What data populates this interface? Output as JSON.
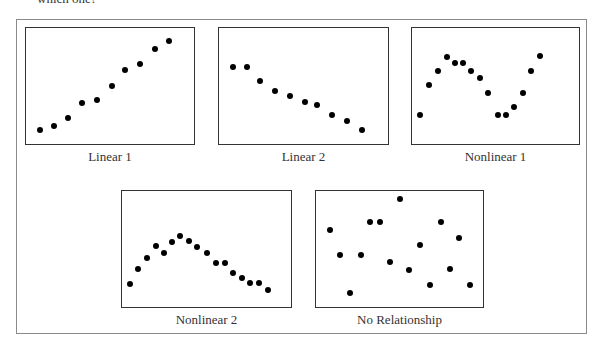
{
  "header": {
    "partial_text": "which one?"
  },
  "chart_data": [
    {
      "type": "scatter",
      "title": "Linear 1",
      "box": {
        "left": 25,
        "top": 27,
        "right": 195,
        "bottom": 145
      },
      "points": [
        [
          40,
          130
        ],
        [
          54,
          126
        ],
        [
          68,
          118
        ],
        [
          82,
          103
        ],
        [
          97,
          100
        ],
        [
          112,
          86
        ],
        [
          125,
          70
        ],
        [
          140,
          64
        ],
        [
          155,
          49
        ],
        [
          169,
          41
        ]
      ],
      "description": "Positive linear relationship"
    },
    {
      "type": "scatter",
      "title": "Linear 2",
      "box": {
        "left": 218,
        "top": 27,
        "right": 389,
        "bottom": 145
      },
      "points": [
        [
          233,
          67
        ],
        [
          247,
          67
        ],
        [
          260,
          81
        ],
        [
          275,
          91
        ],
        [
          290,
          96
        ],
        [
          305,
          102
        ],
        [
          317,
          105
        ],
        [
          332,
          115
        ],
        [
          347,
          121
        ],
        [
          362,
          130
        ]
      ],
      "description": "Negative linear relationship"
    },
    {
      "type": "scatter",
      "title": "Nonlinear 1",
      "box": {
        "left": 411,
        "top": 27,
        "right": 580,
        "bottom": 145
      },
      "points": [
        [
          420,
          115
        ],
        [
          429,
          85
        ],
        [
          438,
          71
        ],
        [
          447,
          57
        ],
        [
          455,
          63
        ],
        [
          463,
          63
        ],
        [
          471,
          71
        ],
        [
          480,
          78
        ],
        [
          488,
          93
        ],
        [
          498,
          115
        ],
        [
          506,
          115
        ],
        [
          514,
          107
        ],
        [
          523,
          93
        ],
        [
          531,
          71
        ],
        [
          540,
          56
        ]
      ],
      "description": "Wave-shaped (cubic) relationship"
    },
    {
      "type": "scatter",
      "title": "Nonlinear 2",
      "box": {
        "left": 121,
        "top": 190,
        "right": 292,
        "bottom": 308
      },
      "points": [
        [
          130,
          284
        ],
        [
          138,
          269
        ],
        [
          147,
          258
        ],
        [
          156,
          246
        ],
        [
          164,
          253
        ],
        [
          172,
          242
        ],
        [
          180,
          236
        ],
        [
          189,
          241
        ],
        [
          197,
          247
        ],
        [
          207,
          253
        ],
        [
          216,
          263
        ],
        [
          225,
          263
        ],
        [
          233,
          273
        ],
        [
          242,
          278
        ],
        [
          250,
          283
        ],
        [
          259,
          283
        ],
        [
          268,
          290
        ]
      ],
      "description": "Inverted-U relationship"
    },
    {
      "type": "scatter",
      "title": "No Relationship",
      "box": {
        "left": 315,
        "top": 190,
        "right": 484,
        "bottom": 308
      },
      "points": [
        [
          330,
          230
        ],
        [
          340,
          255
        ],
        [
          350,
          293
        ],
        [
          361,
          255
        ],
        [
          370,
          222
        ],
        [
          380,
          222
        ],
        [
          390,
          262
        ],
        [
          400,
          199
        ],
        [
          409,
          270
        ],
        [
          420,
          245
        ],
        [
          430,
          285
        ],
        [
          441,
          222
        ],
        [
          450,
          269
        ],
        [
          459,
          238
        ],
        [
          470,
          285
        ]
      ],
      "description": "Random scatter, no relationship"
    }
  ],
  "labels": {
    "linear1": "Linear 1",
    "linear2": "Linear 2",
    "nonlinear1": "Nonlinear 1",
    "nonlinear2": "Nonlinear 2",
    "norel": "No Relationship"
  }
}
